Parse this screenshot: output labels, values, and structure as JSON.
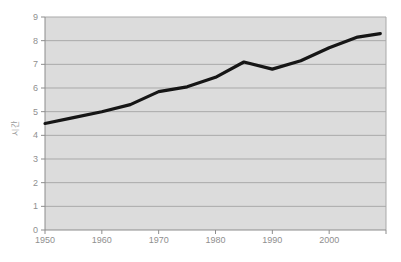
{
  "chart_data": {
    "type": "line",
    "title": "",
    "xlabel": "",
    "ylabel": "시간",
    "x": [
      1950,
      1955,
      1960,
      1965,
      1970,
      1975,
      1980,
      1985,
      1990,
      1995,
      2000,
      2005,
      2009
    ],
    "series": [
      {
        "name": "",
        "values": [
          4.5,
          4.75,
          5.0,
          5.3,
          5.85,
          6.05,
          6.45,
          7.1,
          6.8,
          7.15,
          7.7,
          8.15,
          8.3
        ]
      }
    ],
    "xticks": [
      1950,
      1960,
      1970,
      1980,
      1990,
      2000
    ],
    "yticks": [
      0,
      1,
      2,
      3,
      4,
      5,
      6,
      7,
      8,
      9
    ],
    "xlim": [
      1950,
      2010
    ],
    "ylim": [
      0,
      9
    ],
    "grid": true,
    "legend": false,
    "colors": {
      "line": "#161616",
      "plot_background": "#dcdcdc",
      "gridline": "#a9a9a9",
      "axis": "#8c8c8c",
      "tick_label": "#8f8f8f",
      "page_background": "#ffffff"
    }
  }
}
